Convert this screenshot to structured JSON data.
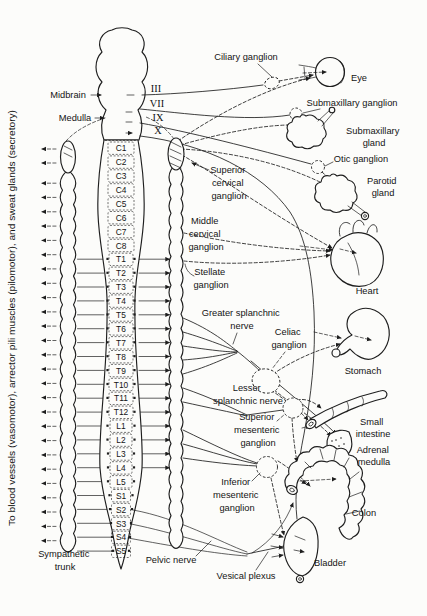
{
  "brainstem": {
    "midbrain": "Midbrain",
    "medulla": "Medulla"
  },
  "cranial_nerves": [
    "III",
    "VII",
    "IX",
    "X"
  ],
  "cord": {
    "segments": [
      "C1",
      "C2",
      "C3",
      "C4",
      "C5",
      "C6",
      "C7",
      "C8",
      "T1",
      "T2",
      "T3",
      "T4",
      "T5",
      "T6",
      "T7",
      "T8",
      "T9",
      "T10",
      "T11",
      "T12",
      "L1",
      "L2",
      "L3",
      "L4",
      "L5",
      "S1",
      "S2",
      "S3",
      "S4",
      "S5"
    ]
  },
  "left_margin_text": "To blood vessels (vasomotor), arrector pili muscles (pilomotor), and sweat glands (secretory)",
  "sympathetic_trunk": [
    "Sympathetic",
    "trunk"
  ],
  "ganglia": {
    "ciliary": "Ciliary ganglion",
    "submaxillary": "Submaxillary ganglion",
    "otic": "Otic ganglion",
    "superior_cervical": [
      "Superior",
      "cervical",
      "ganglion"
    ],
    "middle_cervical": [
      "Middle",
      "cervical",
      "ganglion"
    ],
    "stellate": [
      "Stellate",
      "ganglion"
    ],
    "celiac": [
      "Celiac",
      "ganglion"
    ],
    "superior_mesenteric": [
      "Superior",
      "mesenteric",
      "ganglion"
    ],
    "inferior_mesenteric": [
      "Inferior",
      "mesenteric",
      "ganglion"
    ]
  },
  "nerves": {
    "greater_splanchnic": [
      "Greater splanchnic",
      "nerve"
    ],
    "lesser_splanchnic": [
      "Lesser",
      "splanchnic nerve"
    ],
    "pelvic": "Pelvic nerve",
    "vesical_plexus": "Vesical plexus"
  },
  "organs": {
    "eye": "Eye",
    "submaxillary_gland": [
      "Submaxillary",
      "gland"
    ],
    "parotid_gland": [
      "Parotid",
      "gland"
    ],
    "heart": "Heart",
    "stomach": "Stomach",
    "small_intestine": [
      "Small",
      "intestine"
    ],
    "adrenal_medulla": [
      "Adrenal",
      "medulla"
    ],
    "colon": "Colon",
    "bladder": "Bladder"
  }
}
